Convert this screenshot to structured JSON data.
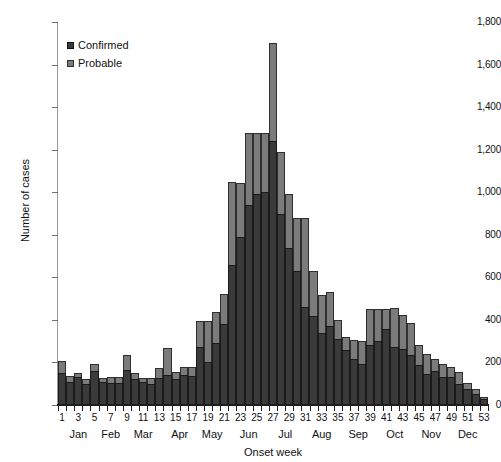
{
  "chart_data": {
    "type": "bar",
    "stacked": true,
    "title": "",
    "xlabel": "Onset week",
    "ylabel": "Number of cases",
    "ylim": [
      0,
      1800
    ],
    "ytick_step": 200,
    "ytick_labels": [
      "1,800",
      "1,600",
      "1,400",
      "1,200",
      "1,000",
      "800",
      "600",
      "400",
      "200",
      "0"
    ],
    "ytick_values": [
      1800,
      1600,
      1400,
      1200,
      1000,
      800,
      600,
      400,
      200,
      0
    ],
    "grid": false,
    "legend_position": "top-left",
    "categories": [
      1,
      2,
      3,
      4,
      5,
      6,
      7,
      8,
      9,
      10,
      11,
      12,
      13,
      14,
      15,
      16,
      17,
      18,
      19,
      20,
      21,
      22,
      23,
      24,
      25,
      26,
      27,
      28,
      29,
      30,
      31,
      32,
      33,
      34,
      35,
      36,
      37,
      38,
      39,
      40,
      41,
      42,
      43,
      44,
      45,
      46,
      47,
      48,
      49,
      50,
      51,
      52,
      53
    ],
    "xtick_labels": [
      "1",
      "",
      "3",
      "",
      "5",
      "",
      "7",
      "",
      "9",
      "",
      "11",
      "",
      "13",
      "",
      "15",
      "",
      "17",
      "",
      "19",
      "",
      "21",
      "",
      "23",
      "",
      "25",
      "",
      "27",
      "",
      "29",
      "",
      "31",
      "",
      "33",
      "",
      "35",
      "",
      "37",
      "",
      "39",
      "",
      "41",
      "",
      "43",
      "",
      "45",
      "",
      "47",
      "",
      "49",
      "",
      "51",
      "",
      "53"
    ],
    "month_labels": [
      {
        "label": "Jan",
        "week_center": 2.5
      },
      {
        "label": "Feb",
        "week_center": 6.5
      },
      {
        "label": "Mar",
        "week_center": 10.5
      },
      {
        "label": "Apr",
        "week_center": 15.0
      },
      {
        "label": "May",
        "week_center": 19.0
      },
      {
        "label": "Jun",
        "week_center": 23.5
      },
      {
        "label": "Jul",
        "week_center": 28.0
      },
      {
        "label": "Aug",
        "week_center": 32.5
      },
      {
        "label": "Sep",
        "week_center": 37.0
      },
      {
        "label": "Oct",
        "week_center": 41.5
      },
      {
        "label": "Nov",
        "week_center": 46.0
      },
      {
        "label": "Dec",
        "week_center": 50.5
      }
    ],
    "series": [
      {
        "name": "Confirmed",
        "color": "#3a3a3a",
        "values": [
          150,
          110,
          130,
          100,
          160,
          110,
          105,
          105,
          165,
          120,
          110,
          100,
          125,
          140,
          120,
          140,
          135,
          275,
          200,
          290,
          380,
          660,
          790,
          940,
          990,
          1000,
          1240,
          900,
          740,
          630,
          460,
          420,
          340,
          370,
          310,
          260,
          215,
          195,
          280,
          300,
          355,
          275,
          265,
          235,
          190,
          145,
          160,
          130,
          130,
          100,
          75,
          50,
          30
        ]
      },
      {
        "name": "Probable",
        "color": "#7b7b7b",
        "values": [
          55,
          25,
          20,
          20,
          35,
          15,
          25,
          25,
          70,
          30,
          15,
          25,
          50,
          130,
          35,
          40,
          45,
          120,
          195,
          145,
          140,
          390,
          255,
          340,
          290,
          280,
          460,
          290,
          250,
          250,
          420,
          210,
          175,
          160,
          90,
          60,
          90,
          105,
          170,
          150,
          95,
          180,
          160,
          150,
          90,
          95,
          55,
          65,
          50,
          55,
          30,
          25,
          10
        ]
      }
    ],
    "totals": [
      205,
      135,
      150,
      120,
      195,
      125,
      130,
      130,
      235,
      150,
      125,
      125,
      175,
      270,
      155,
      180,
      180,
      395,
      395,
      435,
      520,
      1050,
      1045,
      1280,
      1280,
      1280,
      1700,
      1190,
      990,
      880,
      880,
      630,
      515,
      530,
      400,
      320,
      305,
      300,
      450,
      450,
      450,
      455,
      425,
      385,
      280,
      240,
      215,
      195,
      180,
      155,
      105,
      75,
      40
    ]
  },
  "legend": {
    "items": [
      {
        "label": "Confirmed",
        "swatch": "confirmed-swatch"
      },
      {
        "label": "Probable",
        "swatch": "probable-swatch"
      }
    ]
  }
}
